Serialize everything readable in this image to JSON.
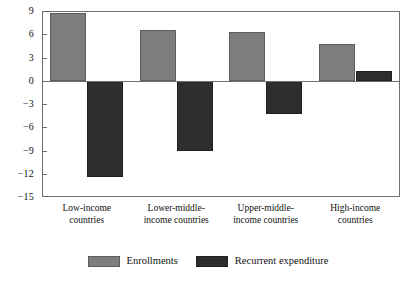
{
  "chart_data": {
    "type": "bar",
    "title": "",
    "subtitle": "",
    "xlabel": "",
    "ylabel": "",
    "ylim": [
      -15,
      9
    ],
    "yticks": [
      9,
      6,
      3,
      0,
      -3,
      -6,
      -9,
      -12,
      -15
    ],
    "ytick_labels": [
      "9",
      "6",
      "3",
      "0",
      "−3",
      "−6",
      "−9",
      "−12",
      "−15"
    ],
    "grid": false,
    "legend_position": "bottom",
    "categories": [
      "Low-income countries",
      "Lower-middle-income countries",
      "Upper-middle-income countries",
      "High-income countries"
    ],
    "category_lines": [
      [
        "Low-income",
        "countries"
      ],
      [
        "Lower-middle-",
        "income countries"
      ],
      [
        "Upper-middle-",
        "income countries"
      ],
      [
        "High-income",
        "countries"
      ]
    ],
    "series": [
      {
        "name": "Enrollments",
        "color": "#7d7d7d",
        "values": [
          8.7,
          6.6,
          6.3,
          4.7
        ]
      },
      {
        "name": "Recurrent expenditure",
        "color": "#2e2e2e",
        "values": [
          -12.4,
          -9.1,
          -4.3,
          1.3
        ]
      }
    ]
  },
  "legend": {
    "entries": [
      {
        "label": "Enrollments",
        "color": "#7d7d7d"
      },
      {
        "label": "Recurrent expenditure",
        "color": "#2e2e2e"
      }
    ]
  },
  "axis": {
    "zero_label": "0",
    "frame_color": "#6f6f6f"
  }
}
